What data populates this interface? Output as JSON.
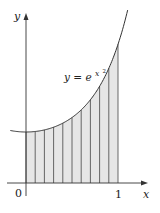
{
  "figure": {
    "function_label": "y = e^{x^2}",
    "function_label_base": "y = e",
    "function_label_exp": "x",
    "function_label_exp2": "2",
    "x_axis_label": "x",
    "y_axis_label": "y",
    "origin_label": "0",
    "x_tick_label": "1"
  },
  "chart_data": {
    "type": "area",
    "title": "",
    "function": "y = e^(x^2)",
    "xlabel": "x",
    "ylabel": "y",
    "x_ticks": [
      "0",
      "1"
    ],
    "shaded_interval": [
      0,
      1
    ],
    "subintervals": 10,
    "strip_edges_x": [
      0,
      0.1,
      0.2,
      0.3,
      0.4,
      0.5,
      0.6,
      0.7,
      0.8,
      0.9,
      1.0
    ],
    "curve_values": [
      {
        "x": 0.0,
        "y": 1.0
      },
      {
        "x": 0.1,
        "y": 1.01
      },
      {
        "x": 0.2,
        "y": 1.041
      },
      {
        "x": 0.3,
        "y": 1.094
      },
      {
        "x": 0.4,
        "y": 1.174
      },
      {
        "x": 0.5,
        "y": 1.284
      },
      {
        "x": 0.6,
        "y": 1.433
      },
      {
        "x": 0.7,
        "y": 1.632
      },
      {
        "x": 0.8,
        "y": 1.896
      },
      {
        "x": 0.9,
        "y": 2.248
      },
      {
        "x": 1.0,
        "y": 2.718
      }
    ],
    "grid": false,
    "colors": {
      "fill": "#e6e6e6",
      "stroke": "#333333",
      "axis": "#333333"
    }
  }
}
